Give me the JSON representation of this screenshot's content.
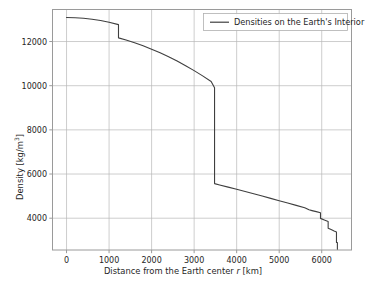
{
  "chart_data": {
    "type": "line",
    "title": "",
    "xlabel": "Distance from the Earth center r [km]",
    "ylabel": "Density [kg/m³]",
    "xlabel_prefix": "Distance from the Earth center ",
    "xlabel_italic": "r",
    "xlabel_suffix": " [km]",
    "legend": [
      "Densities on the Earth's Interior"
    ],
    "legend_position": "upper right",
    "grid": true,
    "xlim": [
      -330,
      6700
    ],
    "ylim": [
      2560,
      13450
    ],
    "xticks": [
      0,
      1000,
      2000,
      3000,
      4000,
      5000,
      6000
    ],
    "xticklabels": [
      "0",
      "1000",
      "2000",
      "3000",
      "4000",
      "5000",
      "6000"
    ],
    "yticks": [
      4000,
      6000,
      8000,
      10000,
      12000
    ],
    "yticklabels": [
      "4000",
      "6000",
      "8000",
      "10000",
      "12000"
    ],
    "line_color": "#3f3f3f",
    "grid_color": "#b8b8b8",
    "axes_color": "#999999",
    "series": [
      {
        "name": "Densities on the Earth's Interior",
        "x": [
          0,
          200,
          400,
          600,
          800,
          1000,
          1221.5,
          1221.5,
          1400,
          1600,
          1800,
          2000,
          2200,
          2400,
          2600,
          2800,
          3000,
          3200,
          3400,
          3480,
          3480,
          3600,
          3800,
          4000,
          4200,
          4400,
          4600,
          4800,
          5000,
          5200,
          5400,
          5600,
          5701,
          5701,
          5771,
          5871,
          5971,
          5971,
          6061,
          6151,
          6151,
          6221,
          6291,
          6346.6,
          6346.6,
          6356,
          6368,
          6368,
          6371
        ],
        "y": [
          13088,
          13079,
          13053,
          13010,
          12949,
          12871,
          12764,
          12166,
          12069,
          11946,
          11809,
          11654,
          11487,
          11308,
          11114,
          10902,
          10682,
          10445,
          10186,
          9903,
          5566,
          5506,
          5406,
          5307,
          5207,
          5105,
          5001,
          4897,
          4792,
          4685,
          4580,
          4475,
          4380,
          4380,
          4344,
          4297,
          4250,
          3992,
          3920,
          3849,
          3550,
          3486,
          3424,
          3380,
          2900,
          2900,
          2900,
          2600,
          2600
        ],
        "color": "#3f3f3f",
        "linewidth": 1.1
      }
    ],
    "annotations": [
      {
        "label": "inner core boundary",
        "x": 1221.5,
        "y_from": 12764,
        "y_to": 12166
      },
      {
        "label": "core-mantle boundary",
        "x": 3480,
        "y_from": 9903,
        "y_to": 5566
      },
      {
        "label": "transition zone step",
        "x": 5971,
        "y_from": 4250,
        "y_to": 3992
      },
      {
        "label": "lithosphere step",
        "x": 6151,
        "y_from": 3849,
        "y_to": 3550
      },
      {
        "label": "moho / crust",
        "x": 6346.6,
        "y_from": 3380,
        "y_to": 2900
      }
    ]
  }
}
